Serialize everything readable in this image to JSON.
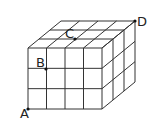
{
  "diagram": {
    "type": "cube-grid",
    "front_cols": 4,
    "front_rows": 3,
    "depth": 3,
    "points": [
      {
        "label": "A",
        "x": 28,
        "y": 109,
        "lx": 20,
        "ly": 118
      },
      {
        "label": "B",
        "x": 46,
        "y": 69,
        "lx": 36,
        "ly": 67
      },
      {
        "label": "C",
        "x": 75,
        "y": 39,
        "lx": 65,
        "ly": 38
      },
      {
        "label": "D",
        "x": 135,
        "y": 21,
        "lx": 137,
        "ly": 26
      }
    ],
    "line_color": "#333333"
  }
}
